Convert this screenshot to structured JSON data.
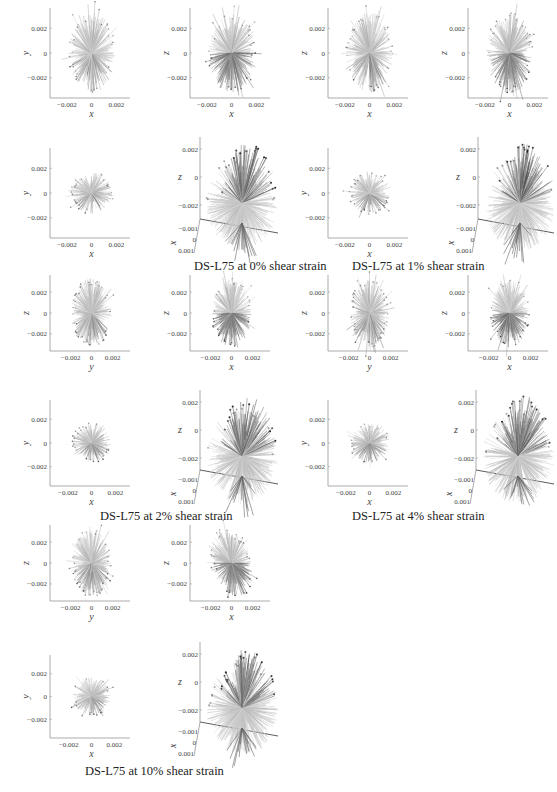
{
  "figure": {
    "groups": [
      {
        "id": "s0",
        "caption": "DS-L75 at 0% shear strain",
        "caption_pos": [
          194,
          259
        ],
        "panels": [
          {
            "kind": "2d",
            "x": 22,
            "y": 8,
            "w": 110,
            "h": 112,
            "xlabel": "x",
            "ylabel": "y",
            "shape": "ellipse",
            "tone": "light"
          },
          {
            "kind": "2d",
            "x": 162,
            "y": 8,
            "w": 110,
            "h": 112,
            "xlabel": "x",
            "ylabel": "z",
            "shape": "ellipse",
            "tone": "dark-bottom"
          },
          {
            "kind": "2d",
            "x": 22,
            "y": 148,
            "w": 110,
            "h": 112,
            "xlabel": "x",
            "ylabel": "y",
            "shape": "circle",
            "tone": "light"
          },
          {
            "kind": "3d",
            "x": 170,
            "y": 135,
            "w": 110,
            "h": 122,
            "xlabel": "x",
            "ylabel": "z",
            "tone": "dark-top"
          }
        ]
      },
      {
        "id": "s1",
        "caption": "DS-L75 at 1% shear strain",
        "caption_pos": [
          352,
          259
        ],
        "panels": [
          {
            "kind": "2d",
            "x": 300,
            "y": 8,
            "w": 110,
            "h": 112,
            "xlabel": "x",
            "ylabel": "z",
            "shape": "ellipse",
            "tone": "light"
          },
          {
            "kind": "2d",
            "x": 440,
            "y": 8,
            "w": 110,
            "h": 112,
            "xlabel": "x",
            "ylabel": "z",
            "shape": "ellipse",
            "tone": "dark-bottom"
          },
          {
            "kind": "2d",
            "x": 300,
            "y": 148,
            "w": 110,
            "h": 112,
            "xlabel": "x",
            "ylabel": "y",
            "shape": "circle",
            "tone": "light"
          },
          {
            "kind": "3d",
            "x": 448,
            "y": 135,
            "w": 108,
            "h": 122,
            "xlabel": "x",
            "ylabel": "z",
            "tone": "dark-top"
          }
        ]
      },
      {
        "id": "s2",
        "caption": "DS-L75 at 2% shear strain",
        "caption_pos": [
          100,
          509
        ],
        "panels": [
          {
            "kind": "2d",
            "x": 22,
            "y": 275,
            "w": 110,
            "h": 98,
            "xlabel": "y",
            "ylabel": "z",
            "shape": "ellipse",
            "tone": "light"
          },
          {
            "kind": "2d",
            "x": 162,
            "y": 275,
            "w": 110,
            "h": 98,
            "xlabel": "x",
            "ylabel": "z",
            "shape": "ellipse",
            "tone": "dark-bottom"
          },
          {
            "kind": "2d",
            "x": 22,
            "y": 400,
            "w": 110,
            "h": 108,
            "xlabel": "x",
            "ylabel": "y",
            "shape": "circle",
            "tone": "light"
          },
          {
            "kind": "3d",
            "x": 170,
            "y": 388,
            "w": 110,
            "h": 120,
            "xlabel": "x",
            "ylabel": "z",
            "tone": "dark-top"
          }
        ]
      },
      {
        "id": "s3",
        "caption": "DS-L75 at 4% shear strain",
        "caption_pos": [
          352,
          509
        ],
        "panels": [
          {
            "kind": "2d",
            "x": 300,
            "y": 275,
            "w": 110,
            "h": 98,
            "xlabel": "y",
            "ylabel": "z",
            "shape": "ellipse",
            "tone": "light"
          },
          {
            "kind": "2d",
            "x": 440,
            "y": 275,
            "w": 110,
            "h": 98,
            "xlabel": "x",
            "ylabel": "z",
            "shape": "ellipse",
            "tone": "dark-bottom"
          },
          {
            "kind": "2d",
            "x": 300,
            "y": 400,
            "w": 110,
            "h": 108,
            "xlabel": "x",
            "ylabel": "y",
            "shape": "circle",
            "tone": "light"
          },
          {
            "kind": "3d",
            "x": 446,
            "y": 388,
            "w": 110,
            "h": 120,
            "xlabel": "x",
            "ylabel": "z",
            "tone": "dark-top"
          }
        ]
      },
      {
        "id": "s10",
        "caption": "DS-L75 at 10% shear strain",
        "caption_pos": [
          85,
          764
        ],
        "panels": [
          {
            "kind": "2d",
            "x": 22,
            "y": 525,
            "w": 110,
            "h": 98,
            "xlabel": "y",
            "ylabel": "z",
            "shape": "ellipse",
            "tone": "light"
          },
          {
            "kind": "2d",
            "x": 162,
            "y": 525,
            "w": 110,
            "h": 98,
            "xlabel": "x",
            "ylabel": "z",
            "shape": "ellipse-tilt",
            "tone": "dark-bottom"
          },
          {
            "kind": "2d",
            "x": 22,
            "y": 655,
            "w": 110,
            "h": 105,
            "xlabel": "x",
            "ylabel": "y",
            "shape": "circle",
            "tone": "light"
          },
          {
            "kind": "3d",
            "x": 170,
            "y": 640,
            "w": 110,
            "h": 120,
            "xlabel": "x",
            "ylabel": "z",
            "tone": "dark-top"
          }
        ]
      }
    ],
    "tick_labels_2d": [
      "-0.002",
      "0",
      "0.002"
    ],
    "tick_labels_3d_z": [
      "0.002",
      "0",
      "-0.002"
    ],
    "tick_labels_3d_x": [
      "-0.001",
      "0",
      "0.001"
    ],
    "colors": {
      "light": "#bdbdbd",
      "mid": "#9a9a9a",
      "dark": "#5a5a5a",
      "axis": "#888888"
    }
  },
  "chart_data": {
    "type": "scatter",
    "subplots_per_condition": [
      "y vs x (or z vs y)",
      "z vs x",
      "y vs x",
      "3D view (x, y, z)"
    ],
    "conditions": [
      {
        "label": "DS-L75 at 0% shear strain",
        "shear_strain_pct": 0
      },
      {
        "label": "DS-L75 at 1% shear strain",
        "shear_strain_pct": 1
      },
      {
        "label": "DS-L75 at 2% shear strain",
        "shear_strain_pct": 2
      },
      {
        "label": "DS-L75 at 4% shear strain",
        "shear_strain_pct": 4
      },
      {
        "label": "DS-L75 at 10% shear strain",
        "shear_strain_pct": 10
      }
    ],
    "axis_ticks_2d": [
      -0.002,
      0,
      0.002
    ],
    "axis_ticks_3d_z": [
      0.002,
      0,
      -0.002
    ],
    "axis_ticks_3d_x": [
      -0.001,
      0,
      0.001
    ],
    "axis_labels": {
      "x": "x",
      "y": "y",
      "z": "z"
    },
    "xlim": [
      -0.004,
      0.004
    ],
    "ylim": [
      -0.004,
      0.004
    ],
    "grid": false,
    "legend": null
  }
}
